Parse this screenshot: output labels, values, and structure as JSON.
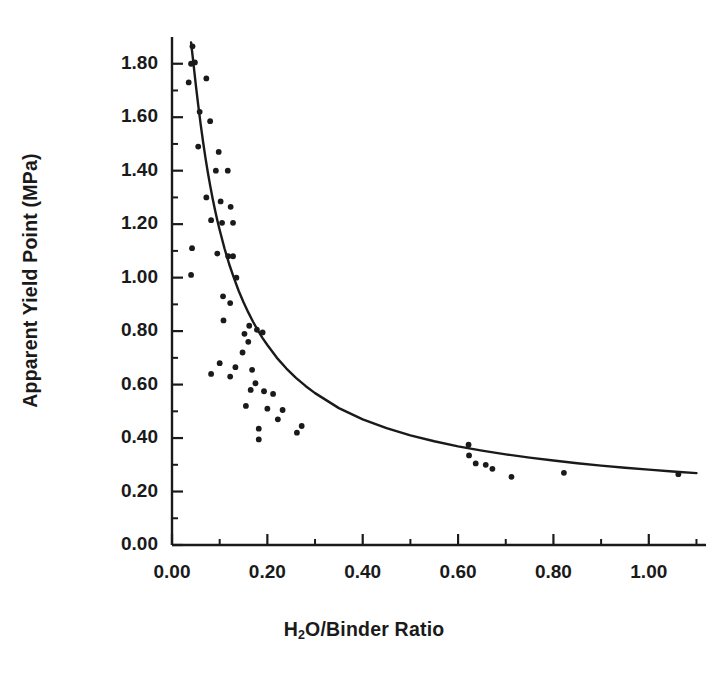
{
  "chart_data": {
    "type": "scatter",
    "title": "",
    "xlabel": "H2O/Binder Ratio",
    "xlabel_parts": {
      "pre": "H",
      "sub": "2",
      "post": "O/Binder Ratio"
    },
    "ylabel": "Apparent Yield Point (MPa)",
    "xlim": [
      0.0,
      1.12
    ],
    "ylim": [
      0.0,
      1.9
    ],
    "xticks": [
      0.0,
      0.2,
      0.4,
      0.6,
      0.8,
      1.0
    ],
    "xticklabels": [
      "0.00",
      "0.20",
      "0.40",
      "0.60",
      "0.80",
      "1.00"
    ],
    "x_minor_ticks": [
      0.1,
      0.3,
      0.5,
      0.7,
      0.9,
      1.1
    ],
    "yticks": [
      0.0,
      0.2,
      0.4,
      0.6,
      0.8,
      1.0,
      1.2,
      1.4,
      1.6,
      1.8
    ],
    "yticklabels": [
      "0.00",
      "0.20",
      "0.40",
      "0.60",
      "0.80",
      "1.00",
      "1.20",
      "1.40",
      "1.60",
      "1.80"
    ],
    "y_minor_ticks": [
      0.1,
      0.3,
      0.5,
      0.7,
      0.9,
      1.1,
      1.3,
      1.5,
      1.7
    ],
    "grid": false,
    "legend": "none",
    "marker": "filled-circle",
    "marker_color": "#1a1a1a",
    "line_color": "#1a1a1a",
    "axis_color": "#1a1a1a",
    "series": [
      {
        "name": "Apparent Yield Point measurements",
        "type": "scatter",
        "points": [
          [
            0.043,
            1.865
          ],
          [
            0.04,
            1.8
          ],
          [
            0.048,
            1.805
          ],
          [
            0.035,
            1.73
          ],
          [
            0.072,
            1.745
          ],
          [
            0.058,
            1.62
          ],
          [
            0.08,
            1.585
          ],
          [
            0.055,
            1.49
          ],
          [
            0.098,
            1.47
          ],
          [
            0.092,
            1.4
          ],
          [
            0.117,
            1.4
          ],
          [
            0.072,
            1.3
          ],
          [
            0.102,
            1.285
          ],
          [
            0.123,
            1.265
          ],
          [
            0.082,
            1.215
          ],
          [
            0.105,
            1.205
          ],
          [
            0.128,
            1.205
          ],
          [
            0.042,
            1.11
          ],
          [
            0.095,
            1.09
          ],
          [
            0.118,
            1.08
          ],
          [
            0.128,
            1.08
          ],
          [
            0.04,
            1.01
          ],
          [
            0.135,
            1.0
          ],
          [
            0.107,
            0.93
          ],
          [
            0.122,
            0.905
          ],
          [
            0.108,
            0.84
          ],
          [
            0.162,
            0.82
          ],
          [
            0.178,
            0.805
          ],
          [
            0.152,
            0.79
          ],
          [
            0.19,
            0.795
          ],
          [
            0.16,
            0.76
          ],
          [
            0.148,
            0.72
          ],
          [
            0.1,
            0.68
          ],
          [
            0.133,
            0.665
          ],
          [
            0.168,
            0.655
          ],
          [
            0.082,
            0.64
          ],
          [
            0.122,
            0.63
          ],
          [
            0.175,
            0.605
          ],
          [
            0.165,
            0.58
          ],
          [
            0.193,
            0.575
          ],
          [
            0.212,
            0.565
          ],
          [
            0.155,
            0.52
          ],
          [
            0.2,
            0.51
          ],
          [
            0.232,
            0.505
          ],
          [
            0.222,
            0.47
          ],
          [
            0.182,
            0.435
          ],
          [
            0.182,
            0.395
          ],
          [
            0.272,
            0.445
          ],
          [
            0.262,
            0.42
          ],
          [
            0.622,
            0.375
          ],
          [
            0.623,
            0.335
          ],
          [
            0.637,
            0.305
          ],
          [
            0.658,
            0.3
          ],
          [
            0.672,
            0.285
          ],
          [
            0.712,
            0.255
          ],
          [
            0.822,
            0.27
          ],
          [
            1.062,
            0.265
          ]
        ]
      },
      {
        "name": "Fitted power-law curve",
        "type": "line",
        "points": [
          [
            0.04,
            1.88
          ],
          [
            0.045,
            1.8
          ],
          [
            0.05,
            1.72
          ],
          [
            0.055,
            1.645
          ],
          [
            0.06,
            1.575
          ],
          [
            0.065,
            1.51
          ],
          [
            0.07,
            1.45
          ],
          [
            0.075,
            1.395
          ],
          [
            0.08,
            1.345
          ],
          [
            0.085,
            1.298
          ],
          [
            0.09,
            1.255
          ],
          [
            0.095,
            1.215
          ],
          [
            0.1,
            1.178
          ],
          [
            0.11,
            1.11
          ],
          [
            0.12,
            1.05
          ],
          [
            0.13,
            0.998
          ],
          [
            0.14,
            0.95
          ],
          [
            0.15,
            0.908
          ],
          [
            0.16,
            0.87
          ],
          [
            0.17,
            0.835
          ],
          [
            0.18,
            0.803
          ],
          [
            0.19,
            0.774
          ],
          [
            0.2,
            0.748
          ],
          [
            0.22,
            0.7
          ],
          [
            0.24,
            0.66
          ],
          [
            0.26,
            0.625
          ],
          [
            0.28,
            0.595
          ],
          [
            0.3,
            0.568
          ],
          [
            0.35,
            0.512
          ],
          [
            0.4,
            0.47
          ],
          [
            0.45,
            0.437
          ],
          [
            0.5,
            0.41
          ],
          [
            0.55,
            0.388
          ],
          [
            0.6,
            0.369
          ],
          [
            0.65,
            0.353
          ],
          [
            0.7,
            0.339
          ],
          [
            0.75,
            0.327
          ],
          [
            0.8,
            0.316
          ],
          [
            0.85,
            0.306
          ],
          [
            0.9,
            0.297
          ],
          [
            0.95,
            0.289
          ],
          [
            1.0,
            0.282
          ],
          [
            1.05,
            0.275
          ],
          [
            1.1,
            0.269
          ]
        ]
      }
    ]
  },
  "axes": {
    "x_axis_name": "x-axis",
    "y_axis_name": "y-axis"
  }
}
